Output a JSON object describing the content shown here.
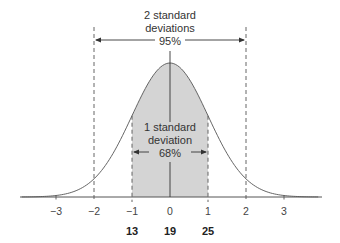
{
  "diagram": {
    "two_sd": {
      "line1": "2 standard",
      "line2": "deviations",
      "percent": "95%",
      "range": [
        -2,
        2
      ]
    },
    "one_sd": {
      "line1": "1 standard",
      "line2": "deviation",
      "percent": "68%",
      "range": [
        -1,
        1
      ]
    },
    "z_ticks": [
      "−3",
      "−2",
      "−1",
      "0",
      "1",
      "2",
      "3"
    ],
    "z_values": [
      -3,
      -2,
      -1,
      0,
      1,
      2,
      3
    ],
    "raw_labels": [
      {
        "z": -1,
        "text": "13"
      },
      {
        "z": 0,
        "text": "19"
      },
      {
        "z": 1,
        "text": "25"
      }
    ],
    "mean": 19,
    "sd": 6,
    "colors": {
      "shade": "#d4d4d4",
      "line": "#555555"
    }
  }
}
